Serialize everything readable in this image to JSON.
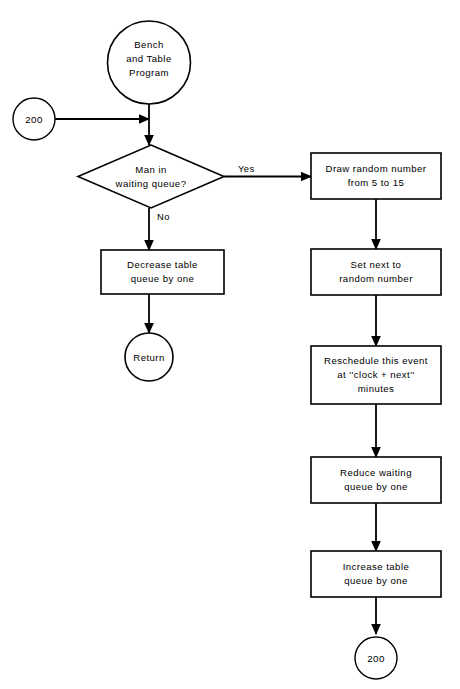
{
  "diagram": {
    "background_color": "#ffffff",
    "line_color": "#000000"
  },
  "nodes": {
    "start": {
      "type": "terminator-circle",
      "lines": [
        "Bench",
        "and Table",
        "Program"
      ]
    },
    "entry_connector": {
      "type": "connector-circle",
      "label": "200"
    },
    "decision": {
      "type": "decision-diamond",
      "lines": [
        "Man in",
        "waiting queue?"
      ],
      "yes_label": "Yes",
      "no_label": "No"
    },
    "decrease_table": {
      "type": "process-box",
      "lines": [
        "Decrease table",
        "queue by one"
      ]
    },
    "return": {
      "type": "terminator-circle",
      "label": "Return"
    },
    "draw_random": {
      "type": "process-box",
      "lines": [
        "Draw random number",
        "from 5 to 15"
      ]
    },
    "set_next": {
      "type": "process-box",
      "lines": [
        "Set next to",
        "random number"
      ]
    },
    "reschedule": {
      "type": "process-box",
      "lines": [
        "Reschedule this event",
        "at ''clock + next''",
        "minutes"
      ]
    },
    "reduce_waiting": {
      "type": "process-box",
      "lines": [
        "Reduce waiting",
        "queue by one"
      ]
    },
    "increase_table": {
      "type": "process-box",
      "lines": [
        "Increase table",
        "queue by one"
      ]
    },
    "exit_connector": {
      "type": "connector-circle",
      "label": "200"
    }
  }
}
